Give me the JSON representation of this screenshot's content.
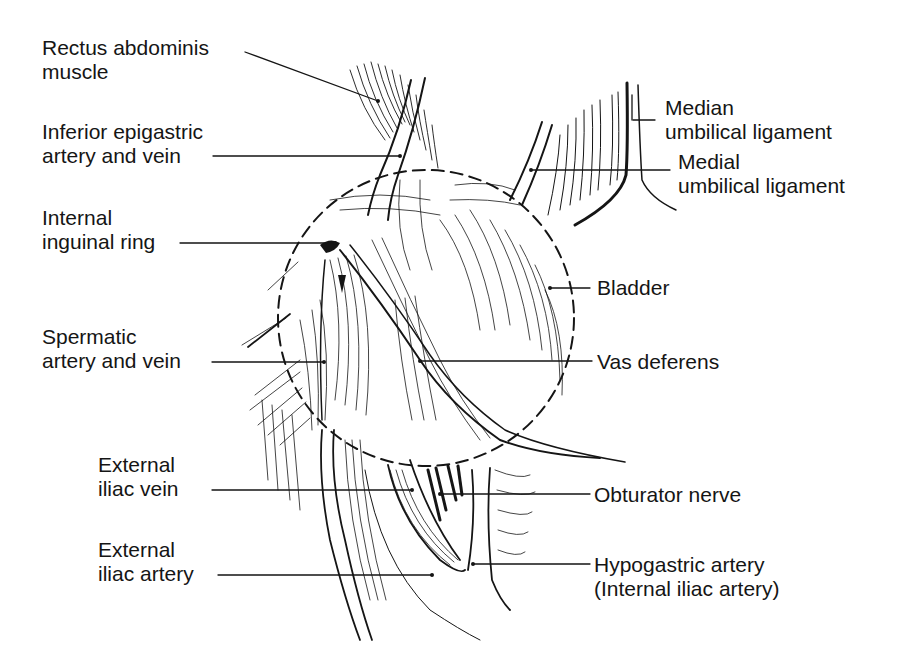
{
  "figure": {
    "labels": {
      "rectus": {
        "line1": "Rectus abdominis",
        "line2": "muscle"
      },
      "inferior_epigastric": {
        "line1": "Inferior epigastric",
        "line2": "artery and vein"
      },
      "internal_ring": {
        "line1": "Internal",
        "line2": "inguinal ring"
      },
      "spermatic": {
        "line1": "Spermatic",
        "line2": "artery and vein"
      },
      "ext_iliac_vein": {
        "line1": "External",
        "line2": "iliac vein"
      },
      "ext_iliac_artery": {
        "line1": "External",
        "line2": "iliac artery"
      },
      "median_umbilical": {
        "line1": "Median",
        "line2": "umbilical ligament"
      },
      "medial_umbilical": {
        "line1": "Medial",
        "line2": "umbilical ligament"
      },
      "bladder": {
        "line1": "Bladder"
      },
      "vas": {
        "line1": "Vas deferens"
      },
      "obturator": {
        "line1": "Obturator nerve"
      },
      "hypogastric": {
        "line1": "Hypogastric artery",
        "line2": "(Internal iliac artery)"
      }
    },
    "colors": {
      "ink": "#151515",
      "background": "#ffffff"
    }
  }
}
